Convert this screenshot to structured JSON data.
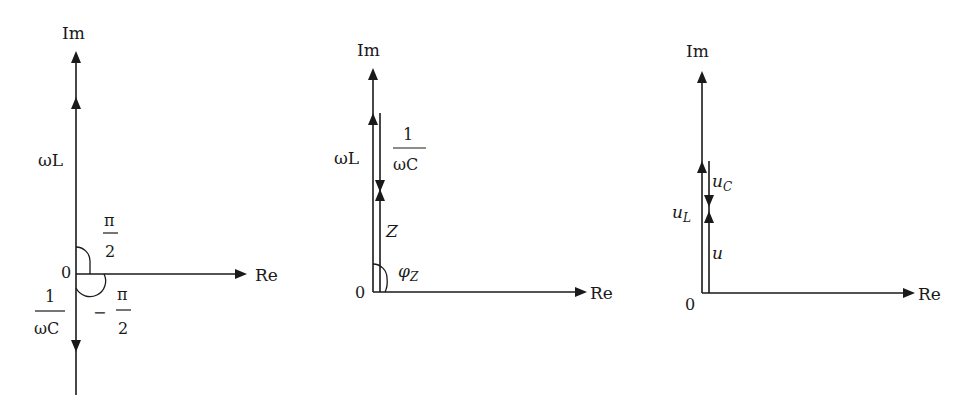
{
  "colors": {
    "ink": "#1a1a1a",
    "background": "#ffffff"
  },
  "diagrams": [
    {
      "id": "reactances",
      "axis_labels": {
        "im": "Im",
        "re": "Re",
        "origin": "0"
      },
      "vectors": [
        {
          "name": "inductive-reactance",
          "label": "ωL",
          "direction": "up"
        },
        {
          "name": "capacitive-reactance",
          "label_num": "1",
          "label_den": "ωC",
          "direction": "down"
        }
      ],
      "angles": [
        {
          "label_num": "π",
          "label_den": "2",
          "sign": ""
        },
        {
          "label_num": "π",
          "label_den": "2",
          "sign": "−"
        }
      ]
    },
    {
      "id": "impedance",
      "axis_labels": {
        "im": "Im",
        "re": "Re",
        "origin": "0"
      },
      "vectors": [
        {
          "name": "inductive-reactance",
          "label": "ωL",
          "direction": "up"
        },
        {
          "name": "capacitive-reactance",
          "label_num": "1",
          "label_den": "ωC",
          "direction": "down"
        },
        {
          "name": "impedance",
          "label": "Z",
          "direction": "up"
        }
      ],
      "angle": {
        "label": "φ",
        "subscript": "Z"
      }
    },
    {
      "id": "voltages",
      "axis_labels": {
        "im": "Im",
        "re": "Re",
        "origin": "0"
      },
      "vectors": [
        {
          "name": "inductor-voltage",
          "label": "u",
          "subscript": "L",
          "direction": "up"
        },
        {
          "name": "capacitor-voltage",
          "label": "u",
          "subscript": "C",
          "direction": "down"
        },
        {
          "name": "total-voltage",
          "label": "u",
          "direction": "up"
        }
      ]
    }
  ]
}
